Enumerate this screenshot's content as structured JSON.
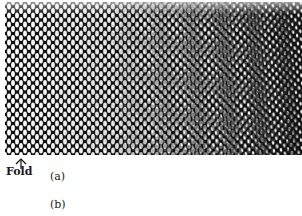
{
  "figure": {
    "type": "moire-mesh-photograph",
    "colors": {
      "ink": "#111111",
      "paper": "#ffffff"
    },
    "fold": {
      "label": "Fold",
      "marker_icon": "up-arrow-icon"
    },
    "captions": [
      {
        "label": "(a)"
      },
      {
        "label": "(b)"
      }
    ]
  }
}
